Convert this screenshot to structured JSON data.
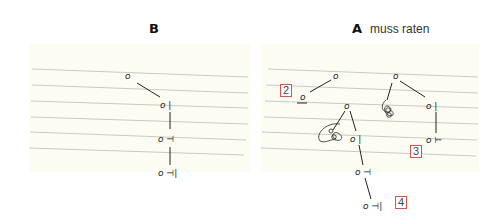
{
  "panels": [
    {
      "id": "B",
      "label": "B",
      "note": "",
      "tree": {
        "nodes": [
          {
            "id": "b-root",
            "text": "o",
            "x": 126,
            "y": 79
          },
          {
            "id": "b-n1",
            "text": "o |",
            "x": 160,
            "y": 108
          },
          {
            "id": "b-n2",
            "text": "o ⊣",
            "x": 158,
            "y": 142
          },
          {
            "id": "b-n3",
            "text": "o ⊣|",
            "x": 158,
            "y": 176
          }
        ],
        "edges": [
          {
            "from": "b-root",
            "to": "b-n1"
          },
          {
            "from": "b-n1",
            "to": "b-n2"
          },
          {
            "from": "b-n2",
            "to": "b-n3"
          }
        ]
      }
    },
    {
      "id": "A",
      "label": "A",
      "note": "muss raten",
      "tree": {
        "nodes": [
          {
            "id": "a-root1",
            "text": "o",
            "x": 334,
            "y": 79
          },
          {
            "id": "a-n1",
            "text": "o",
            "x": 302,
            "y": 99,
            "underlined": true
          },
          {
            "id": "a-n2",
            "text": "o",
            "x": 345,
            "y": 108
          },
          {
            "id": "a-scribble1",
            "text": "scribble",
            "x": 330,
            "y": 135
          },
          {
            "id": "a-n3",
            "text": "o |",
            "x": 351,
            "y": 141
          },
          {
            "id": "a-n4",
            "text": "o ⊣",
            "x": 356,
            "y": 174
          },
          {
            "id": "a-n5",
            "text": "o ⊣|",
            "x": 364,
            "y": 208
          },
          {
            "id": "a-root2",
            "text": "o",
            "x": 394,
            "y": 79
          },
          {
            "id": "a-scribble2",
            "text": "scribble",
            "x": 385,
            "y": 110
          },
          {
            "id": "a-n6",
            "text": "o |",
            "x": 427,
            "y": 108
          },
          {
            "id": "a-n7",
            "text": "o ⊢",
            "x": 427,
            "y": 142
          }
        ]
      },
      "tags": [
        {
          "label": "2",
          "x": 280,
          "y": 84
        },
        {
          "label": "3",
          "x": 410,
          "y": 145
        },
        {
          "label": "4",
          "x": 395,
          "y": 196
        }
      ]
    }
  ],
  "colors": {
    "paper": "#fdfcf3",
    "rule_line": "#c9c9c9",
    "ink": "#222222",
    "tag_border": "#d9534f"
  }
}
